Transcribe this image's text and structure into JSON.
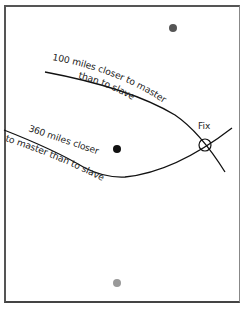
{
  "diagram": {
    "stations": [
      {
        "role": "slave-1",
        "color": "#555555",
        "cx": 173,
        "cy": 28
      },
      {
        "role": "master",
        "color": "#111111",
        "cx": 117,
        "cy": 149
      },
      {
        "role": "slave-2",
        "color": "#999999",
        "cx": 117,
        "cy": 283
      }
    ],
    "lines": [
      {
        "label_line1": "100 miles closer to master",
        "label_line2": "than to slave"
      },
      {
        "label_line1": "360 miles closer",
        "label_line2": "to master than to slave"
      }
    ],
    "fix": {
      "label": "Fix",
      "cx": 205,
      "cy": 145
    }
  }
}
